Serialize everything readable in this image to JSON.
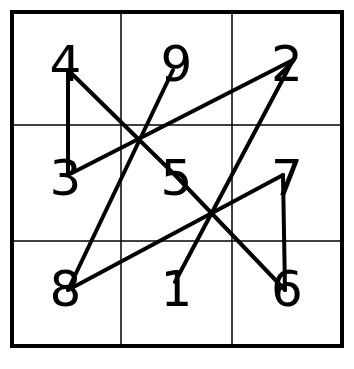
{
  "diagram": {
    "grid": {
      "rows": 3,
      "cols": 3,
      "outer": {
        "x1": 12,
        "y1": 12,
        "x2": 342,
        "y2": 346
      },
      "col_lines": [
        121,
        232
      ],
      "row_lines": [
        125,
        241
      ],
      "border_color": "#000000",
      "line_color": "#000000"
    },
    "cells": [
      [
        "4",
        "9",
        "2"
      ],
      [
        "3",
        "5",
        "7"
      ],
      [
        "8",
        "1",
        "6"
      ]
    ],
    "path_order": [
      "1",
      "2",
      "3",
      "4",
      "5",
      "6",
      "7",
      "8",
      "9"
    ],
    "path_points": {
      "1": [
        175,
        282
      ],
      "2": [
        293,
        60
      ],
      "3": [
        68,
        175
      ],
      "4": [
        68,
        70
      ],
      "5": [
        175,
        175
      ],
      "6": [
        285,
        290
      ],
      "7": [
        283,
        175
      ],
      "8": [
        68,
        290
      ],
      "9": [
        173,
        70
      ]
    }
  }
}
